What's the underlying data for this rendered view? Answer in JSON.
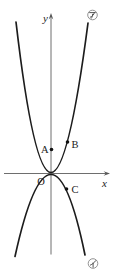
{
  "figure": {
    "background": "#ffffff",
    "curve_color": "#1c1c1c",
    "axis_color": "#6e6e6e",
    "label_color": "#222222",
    "axes": {
      "x_label": "x",
      "y_label": "y",
      "origin_label": "O"
    },
    "points": [
      {
        "label": "A",
        "position": "on y-axis above origin"
      },
      {
        "label": "B",
        "position": "on upper curve, first quadrant"
      },
      {
        "label": "C",
        "position": "on lower curve, fourth quadrant"
      }
    ],
    "curve_tags": [
      {
        "label": "ア",
        "meaning": "katakana-a badge",
        "position": "top-right, labels upward parabola"
      },
      {
        "label": "イ",
        "meaning": "katakana-i badge",
        "position": "bottom-right, labels downward parabola"
      }
    ],
    "curves": [
      {
        "name": "curve-a",
        "shape": "upward-opening parabola, vertex at origin, narrow"
      },
      {
        "name": "curve-i",
        "shape": "downward-opening parabola, vertex at origin, wider"
      }
    ]
  }
}
